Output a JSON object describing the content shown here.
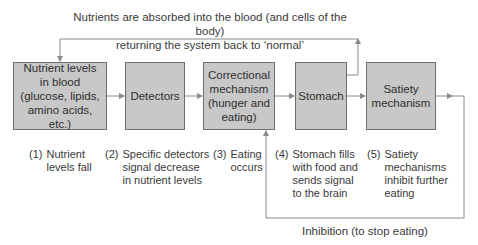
{
  "top_label": {
    "line1": "Nutrients are absorbed into the blood (and cells of the body)",
    "line2": "returning the system back to ‘normal’"
  },
  "boxes": [
    {
      "id": "nutrient-levels",
      "label": "Nutrient levels in blood (glucose, lipids, amino acids, etc.)"
    },
    {
      "id": "detectors",
      "label": "Detectors"
    },
    {
      "id": "correctional-mechanism",
      "label": "Correctional mechanism (hunger and eating)"
    },
    {
      "id": "stomach",
      "label": "Stomach"
    },
    {
      "id": "satiety-mechanism",
      "label": "Satiety mechanism"
    }
  ],
  "captions": [
    {
      "num": "(1)",
      "text": "Nutrient\nlevels fall"
    },
    {
      "num": "(2)",
      "text": "Specific detectors\nsignal decrease\nin nutrient levels"
    },
    {
      "num": "(3)",
      "text": "Eating\noccurs"
    },
    {
      "num": "(4)",
      "text": "Stomach fills\nwith food and\nsends signal\nto the brain"
    },
    {
      "num": "(5)",
      "text": "Satiety\nmechanisms\ninhibit further\neating"
    }
  ],
  "bottom_label": "Inhibition (to stop eating)",
  "colors": {
    "box_fill": "#c8c8c8",
    "box_border": "#6d6d6d",
    "line": "#8a8a8a"
  }
}
